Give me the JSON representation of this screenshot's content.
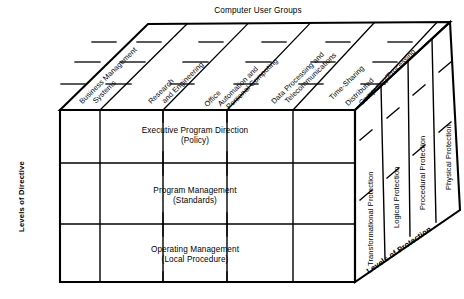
{
  "diagram": {
    "title": "Computer User Groups",
    "axes": {
      "left_label": "Levels of Directive",
      "right_label": "Levels of Protection",
      "top_label": "Computer User Groups"
    },
    "user_groups": [
      {
        "line1": "Business Management",
        "line2": "Systems"
      },
      {
        "line1": "Research",
        "line2": "and Engineering"
      },
      {
        "line1": "Office",
        "line2": "Automation and",
        "line3": "Personal Computing"
      },
      {
        "line1": "Data Processing and",
        "line2": "Telecommunications"
      },
      {
        "line1": "Time-Sharing"
      },
      {
        "line1": "Distributed",
        "line2": "Computing/Processing"
      }
    ],
    "directive_levels": [
      {
        "name": "Executive Program Direction",
        "qualifier": "(Policy)"
      },
      {
        "name": "Program Management",
        "qualifier": "(Standards)"
      },
      {
        "name": "Operating Management",
        "qualifier": "(Local Procedure)"
      }
    ],
    "protection_levels": [
      "Transformational Protection",
      "Logical Protection",
      "Procedural Protection",
      "Physical Protection"
    ],
    "colors": {
      "ink": "#000000",
      "paper": "#ffffff"
    }
  }
}
